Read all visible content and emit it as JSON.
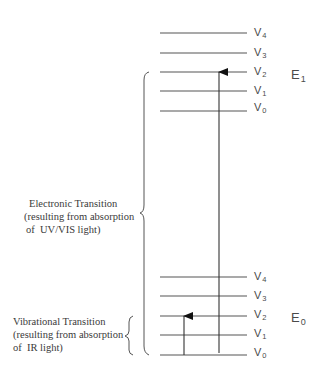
{
  "diagram": {
    "upper_state": {
      "label": "E",
      "subscript": "1",
      "levels": [
        {
          "label": "V",
          "subscript": "4"
        },
        {
          "label": "V",
          "subscript": "3"
        },
        {
          "label": "V",
          "subscript": "2"
        },
        {
          "label": "V",
          "subscript": "1"
        },
        {
          "label": "V",
          "subscript": "0"
        }
      ]
    },
    "lower_state": {
      "label": "E",
      "subscript": "0",
      "levels": [
        {
          "label": "V",
          "subscript": "4"
        },
        {
          "label": "V",
          "subscript": "3"
        },
        {
          "label": "V",
          "subscript": "2"
        },
        {
          "label": "V",
          "subscript": "1"
        },
        {
          "label": "V",
          "subscript": "0"
        }
      ]
    },
    "electronic_transition": {
      "lines": [
        "Electronic Transition",
        "(resulting from absorption",
        "of  UV/VIS light)"
      ],
      "from": "E0 V0",
      "to": "E1 V2"
    },
    "vibrational_transition": {
      "lines": [
        "Vibrational Transition",
        "(resulting from absorption",
        "of  IR light)"
      ],
      "from": "E0 V0",
      "to": "E0 V2"
    },
    "colors": {
      "line": "#555555",
      "text": "#3a3a3a",
      "background": "#ffffff"
    }
  }
}
